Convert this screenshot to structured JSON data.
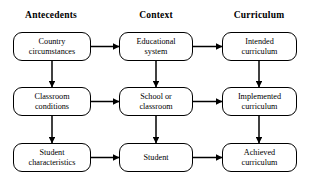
{
  "figure": {
    "type": "flowchart",
    "width": 311,
    "height": 193,
    "background": "#ffffff",
    "line_color": "#000000"
  },
  "headers": [
    {
      "label": "Antecedents",
      "cx": 51
    },
    {
      "label": "Context",
      "cx": 156
    },
    {
      "label": "Curriculum",
      "cx": 259
    }
  ],
  "nodes": [
    {
      "id": "country-circumstances",
      "label": "Country\ncircumstances",
      "x": 13,
      "y": 32,
      "w": 78,
      "h": 29
    },
    {
      "id": "educational-system",
      "label": "Educational\nsystem",
      "x": 119,
      "y": 32,
      "w": 74,
      "h": 29
    },
    {
      "id": "intended-curriculum",
      "label": "Intended\ncurriculum",
      "x": 222,
      "y": 32,
      "w": 75,
      "h": 29
    },
    {
      "id": "classroom-conditions",
      "label": "Classroom\nconditions",
      "x": 13,
      "y": 87,
      "w": 78,
      "h": 29
    },
    {
      "id": "school-or-classroom",
      "label": "School or\nclassroom",
      "x": 119,
      "y": 87,
      "w": 74,
      "h": 29
    },
    {
      "id": "implemented-curriculum",
      "label": "Implemented\ncurriculum",
      "x": 222,
      "y": 87,
      "w": 75,
      "h": 29
    },
    {
      "id": "student-characteristics",
      "label": "Student\ncharacteristics",
      "x": 13,
      "y": 143,
      "w": 78,
      "h": 29
    },
    {
      "id": "student",
      "label": "Student",
      "x": 119,
      "y": 143,
      "w": 74,
      "h": 29
    },
    {
      "id": "achieved-curriculum",
      "label": "Achieved\ncurriculum",
      "x": 222,
      "y": 143,
      "w": 75,
      "h": 29
    }
  ],
  "edges": [
    {
      "id": "country-to-educational",
      "from": "country-circumstances",
      "to": "educational-system",
      "orientation": "horizontal",
      "direction": "forward",
      "x1": 91,
      "y1": 46.5,
      "x2": 119,
      "y2": 46.5
    },
    {
      "id": "educational-to-intended",
      "from": "educational-system",
      "to": "intended-curriculum",
      "orientation": "horizontal",
      "direction": "forward",
      "x1": 193,
      "y1": 46.5,
      "x2": 222,
      "y2": 46.5
    },
    {
      "id": "classroom-to-school",
      "from": "classroom-conditions",
      "to": "school-or-classroom",
      "orientation": "horizontal",
      "direction": "forward",
      "x1": 91,
      "y1": 101.5,
      "x2": 119,
      "y2": 101.5
    },
    {
      "id": "school-to-implemented",
      "from": "school-or-classroom",
      "to": "implemented-curriculum",
      "orientation": "horizontal",
      "direction": "forward",
      "x1": 193,
      "y1": 101.5,
      "x2": 222,
      "y2": 101.5
    },
    {
      "id": "studentchar-to-student",
      "from": "student-characteristics",
      "to": "student",
      "orientation": "horizontal",
      "direction": "forward",
      "x1": 91,
      "y1": 157.5,
      "x2": 119,
      "y2": 157.5
    },
    {
      "id": "student-to-achieved",
      "from": "student",
      "to": "achieved-curriculum",
      "orientation": "horizontal",
      "direction": "forward",
      "x1": 193,
      "y1": 157.5,
      "x2": 222,
      "y2": 157.5
    },
    {
      "id": "country-to-classroom",
      "from": "country-circumstances",
      "to": "classroom-conditions",
      "orientation": "vertical",
      "direction": "forward",
      "x1": 52,
      "y1": 61,
      "x2": 52,
      "y2": 87
    },
    {
      "id": "classroom-studentchar",
      "from": "classroom-conditions",
      "to": "student-characteristics",
      "orientation": "vertical",
      "direction": "bidirectional",
      "x1": 52,
      "y1": 116,
      "x2": 52,
      "y2": 143
    },
    {
      "id": "educational-school",
      "from": "educational-system",
      "to": "school-or-classroom",
      "orientation": "vertical",
      "direction": "bidirectional",
      "x1": 156,
      "y1": 61,
      "x2": 156,
      "y2": 87
    },
    {
      "id": "school-student",
      "from": "school-or-classroom",
      "to": "student",
      "orientation": "vertical",
      "direction": "bidirectional",
      "x1": 156,
      "y1": 116,
      "x2": 156,
      "y2": 143
    },
    {
      "id": "intended-to-implemented",
      "from": "intended-curriculum",
      "to": "implemented-curriculum",
      "orientation": "vertical",
      "direction": "forward",
      "x1": 259,
      "y1": 61,
      "x2": 259,
      "y2": 87
    },
    {
      "id": "implemented-to-achieved",
      "from": "implemented-curriculum",
      "to": "achieved-curriculum",
      "orientation": "vertical",
      "direction": "forward",
      "x1": 259,
      "y1": 116,
      "x2": 259,
      "y2": 143
    }
  ]
}
